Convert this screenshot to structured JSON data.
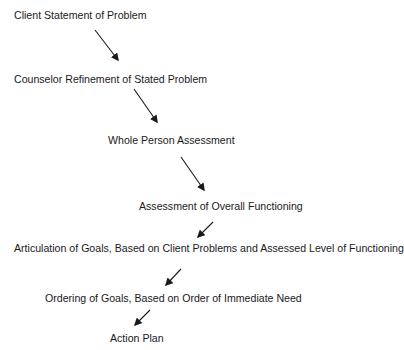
{
  "diagram": {
    "steps": [
      {
        "label": "Client Statement of Problem",
        "x": 14,
        "y": 9
      },
      {
        "label": "Counselor Refinement of Stated Problem",
        "x": 14,
        "y": 73
      },
      {
        "label": "Whole Person Assessment",
        "x": 108,
        "y": 134
      },
      {
        "label": "Assessment of Overall Functioning",
        "x": 139,
        "y": 200
      },
      {
        "label": "Articulation of Goals, Based on Client Problems and Assessed Level of Functioning",
        "x": 14,
        "y": 242
      },
      {
        "label": "Ordering of Goals, Based on Order of Immediate Need",
        "x": 45,
        "y": 292
      },
      {
        "label": "Action Plan",
        "x": 110,
        "y": 332
      }
    ],
    "arrows": [
      {
        "from": "Client Statement of Problem",
        "to": "Counselor Refinement of Stated Problem"
      },
      {
        "from": "Counselor Refinement of Stated Problem",
        "to": "Whole Person Assessment"
      },
      {
        "from": "Whole Person Assessment",
        "to": "Assessment of Overall Functioning"
      },
      {
        "from": "Assessment of Overall Functioning",
        "to": "Articulation of Goals, Based on Client Problems and Assessed Level of Functioning"
      },
      {
        "from": "Articulation of Goals, Based on Client Problems and Assessed Level of Functioning",
        "to": "Ordering of Goals, Based on Order of Immediate Need"
      },
      {
        "from": "Ordering of Goals, Based on Order of Immediate Need",
        "to": "Action Plan"
      }
    ],
    "colors": {
      "text": "#1a1a1a",
      "arrow": "#1a1a1a",
      "background": "#ffffff"
    }
  }
}
